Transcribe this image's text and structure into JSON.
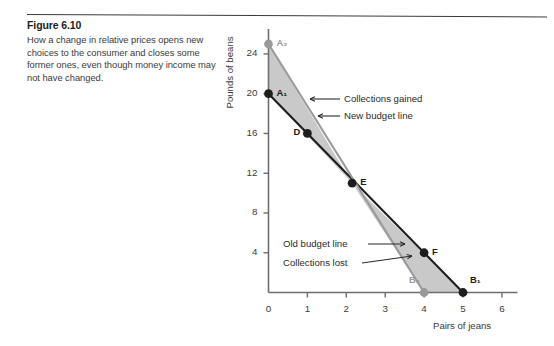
{
  "figure": {
    "number_label": "Figure 6.10",
    "caption": "How a change in relative prices opens new choices to the consumer and closes some former ones, even though money income may not have changed."
  },
  "chart_data": {
    "type": "line",
    "title": "",
    "xlabel": "Pairs of jeans",
    "ylabel": "Pounds of beans",
    "xlim": [
      0,
      6.4
    ],
    "ylim": [
      0,
      26.5
    ],
    "xticks": [
      0,
      1,
      2,
      3,
      4,
      5,
      6
    ],
    "xtick_labels": [
      "0",
      "1",
      "2",
      "3",
      "4",
      "5",
      "6"
    ],
    "yticks": [
      4,
      8,
      12,
      16,
      20,
      24
    ],
    "ytick_labels": [
      "4",
      "8",
      "12",
      "16",
      "20",
      "24"
    ],
    "grid": false,
    "legend": "none",
    "series": [
      {
        "name": "Old budget line",
        "color": "#1d1d1d",
        "style": "solid",
        "x": [
          0,
          5
        ],
        "y": [
          20,
          0
        ],
        "endpoints": [
          "A1",
          "B1"
        ]
      },
      {
        "name": "New budget line",
        "color": "#9a9a9a",
        "style": "solid",
        "x": [
          0,
          4
        ],
        "y": [
          25,
          0
        ],
        "endpoints": [
          "A2",
          "B2"
        ]
      }
    ],
    "shaded_regions": [
      {
        "name": "Collections gained",
        "color": "#c9c9c9",
        "polygon": [
          [
            0,
            20
          ],
          [
            0,
            25
          ],
          [
            2.15,
            11
          ]
        ]
      },
      {
        "name": "Collections lost",
        "color": "#c9c9c9",
        "polygon": [
          [
            2.15,
            11
          ],
          [
            4,
            0
          ],
          [
            5,
            0
          ]
        ]
      }
    ],
    "points": [
      {
        "label": "A2",
        "x": 0,
        "y": 25,
        "marker": "filled-circle",
        "color": "#9a9a9a",
        "label_pos": "right"
      },
      {
        "label": "A1",
        "x": 0,
        "y": 20,
        "marker": "filled-circle",
        "color": "#1d1d1d",
        "label_pos": "right"
      },
      {
        "label": "D",
        "x": 1,
        "y": 16,
        "marker": "filled-circle",
        "color": "#1d1d1d",
        "label_pos": "left"
      },
      {
        "label": "E",
        "x": 2.15,
        "y": 11,
        "marker": "filled-circle",
        "color": "#1d1d1d",
        "label_pos": "right"
      },
      {
        "label": "F",
        "x": 4,
        "y": 4,
        "marker": "filled-circle",
        "color": "#1d1d1d",
        "label_pos": "right"
      },
      {
        "label": "B2",
        "x": 4,
        "y": 0,
        "marker": "filled-circle",
        "color": "#9a9a9a",
        "label_pos": "above-left"
      },
      {
        "label": "B1",
        "x": 5,
        "y": 0,
        "marker": "filled-circle",
        "color": "#1d1d1d",
        "label_pos": "above-right"
      }
    ],
    "annotations": [
      {
        "text": "Collections gained",
        "arrow": "left",
        "text_x": 344,
        "text_y": 95,
        "tail_x": 340,
        "tail_y": 99,
        "head_x": 310,
        "head_y": 99
      },
      {
        "text": "New budget line",
        "arrow": "left",
        "text_x": 344,
        "text_y": 112,
        "tail_x": 340,
        "tail_y": 116,
        "head_x": 318,
        "head_y": 116
      },
      {
        "text": "Old budget line",
        "arrow": "right",
        "text_x": 283,
        "text_y": 240,
        "tail_x": 368,
        "tail_y": 244,
        "head_x": 405,
        "head_y": 244
      },
      {
        "text": "Collections lost",
        "arrow": "right",
        "text_x": 283,
        "text_y": 259,
        "tail_x": 362,
        "tail_y": 263,
        "head_x": 412,
        "head_y": 256
      }
    ],
    "point_labels_display": {
      "A2": "A₂",
      "A1": "A₁",
      "D": "D",
      "E": "E",
      "F": "F",
      "B2": "B₂",
      "B1": "B₁"
    },
    "colors": {
      "old_line": "#1d1d1d",
      "new_line": "#9a9a9a",
      "shaded": "#c9c9c9",
      "axis": "#6e6e6e",
      "text": "#2b2b2b"
    }
  }
}
